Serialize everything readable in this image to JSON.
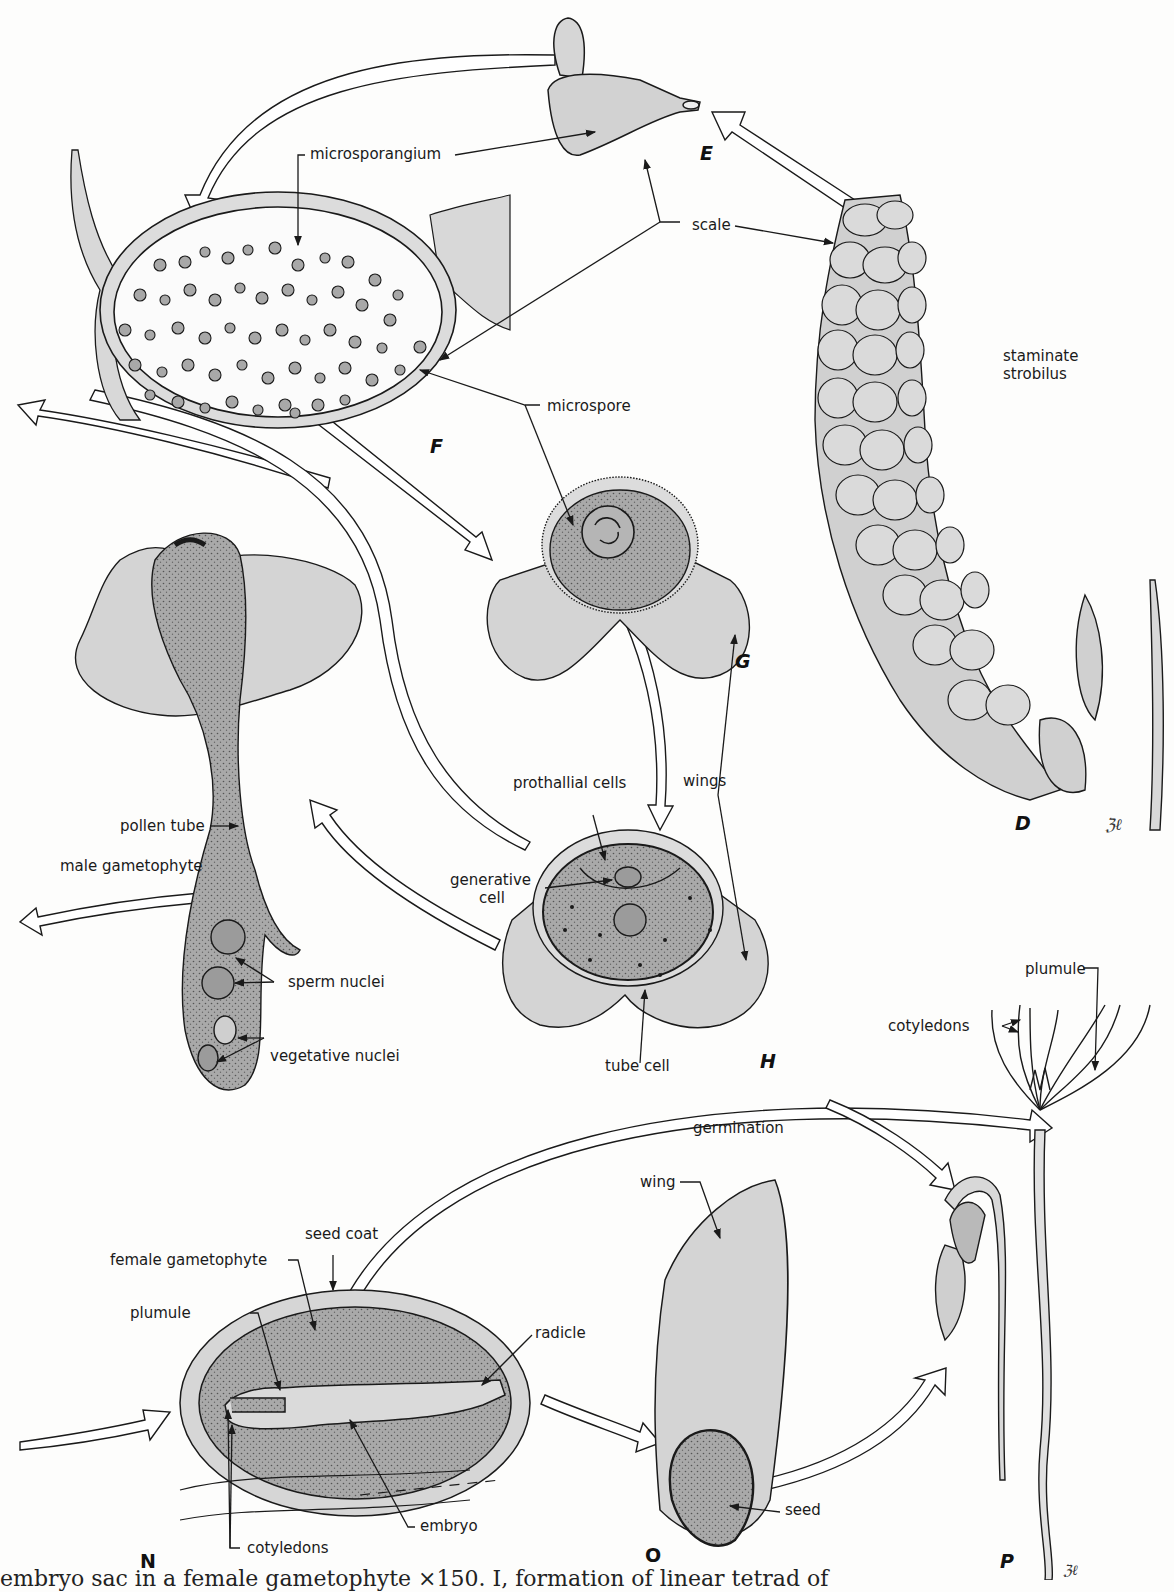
{
  "figure": {
    "panels": [
      {
        "id": "D",
        "label": "D",
        "subject": "staminate strobilus"
      },
      {
        "id": "E",
        "label": "E",
        "subject": "microsporophyll scale"
      },
      {
        "id": "F",
        "label": "F",
        "subject": "microsporangium section with microspores"
      },
      {
        "id": "G",
        "label": "G",
        "subject": "winged microspore"
      },
      {
        "id": "H",
        "label": "H",
        "subject": "pollen grain with prothallial, generative and tube cells"
      },
      {
        "id": "M",
        "label": "",
        "subject": "male gametophyte / pollen tube"
      },
      {
        "id": "N",
        "label": "N",
        "subject": "seed section"
      },
      {
        "id": "O",
        "label": "O",
        "subject": "winged seed"
      },
      {
        "id": "P",
        "label": "P",
        "subject": "germinating seedling"
      }
    ]
  },
  "labels": {
    "microsporangium": "microsporangium",
    "scale": "scale",
    "staminate_1": "staminate",
    "staminate_2": "strobilus",
    "microspore": "microspore",
    "prothallial_cells": "prothallial cells",
    "wings": "wings",
    "generative_1": "generative",
    "generative_2": "cell",
    "tube_cell": "tube cell",
    "pollen_tube": "pollen tube",
    "male_gametophyte": "male  gametophyte",
    "sperm_nuclei": "sperm nuclei",
    "vegetative_nuclei": "vegetative nuclei",
    "plumule_p": "plumule",
    "cotyledons_p": "cotyledons",
    "germination": "germination",
    "wing": "wing",
    "seed": "seed",
    "seed_coat": "seed coat",
    "female_gametophyte": "female gametophyte",
    "plumule_n": "plumule",
    "radicle": "radicle",
    "embryo": "embryo",
    "cotyledons_n": "cotyledons"
  },
  "panel_letters": {
    "D": "D",
    "E": "E",
    "F": "F",
    "G": "G",
    "H": "H",
    "N": "N",
    "O": "O",
    "P": "P"
  },
  "caption": "embryo sac in a female gametophyte  ×150.  I, formation of linear tetrad of",
  "colors": {
    "background": "#fdfdfc",
    "ink": "#1a1a1a",
    "light_fill": "#d6d6d6",
    "mid_fill": "#b4b4b4",
    "dark_fill": "#9a9a9a"
  }
}
